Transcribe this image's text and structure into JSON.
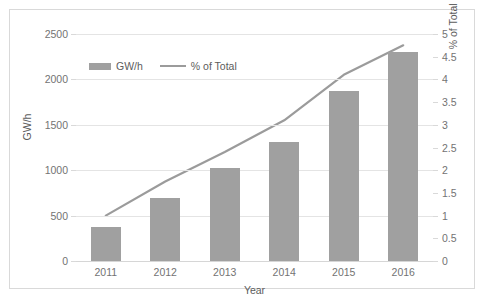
{
  "chart_data": {
    "type": "bar",
    "title": "",
    "subtitle": "",
    "xlabel": "Year",
    "ylabel": "GW/h",
    "y2label": "% of Total electricity production",
    "categories": [
      "2011",
      "2012",
      "2013",
      "2014",
      "2015",
      "2016"
    ],
    "series": [
      {
        "name": "GW/h",
        "type": "bar",
        "axis": "left",
        "color": "#a0a0a0",
        "values": [
          380,
          690,
          1020,
          1310,
          1870,
          2300
        ]
      },
      {
        "name": "% of Total",
        "type": "line",
        "axis": "right",
        "color": "#9b9b9b",
        "values": [
          1.0,
          1.75,
          2.4,
          3.1,
          4.1,
          4.75
        ]
      }
    ],
    "ylim": [
      0,
      2500
    ],
    "y2lim": [
      0,
      5
    ],
    "yticks": [
      0,
      500,
      1000,
      1500,
      2000,
      2500
    ],
    "yticklabels": [
      "0",
      "500",
      "1000",
      "1500",
      "2000",
      "2500"
    ],
    "y2ticks": [
      0,
      0.5,
      1,
      1.5,
      2,
      2.5,
      3,
      3.5,
      4,
      4.5,
      5
    ],
    "y2ticklabels": [
      "0",
      "0.5",
      "1",
      "1.5",
      "2",
      "2.5",
      "3",
      "3.5",
      "4",
      "4.5",
      "5"
    ],
    "grid": true,
    "legend": {
      "position": "top-left-inside",
      "entries": [
        {
          "label": "GW/h",
          "marker": "bar-swatch"
        },
        {
          "label": "% of Total",
          "marker": "line-swatch"
        }
      ]
    },
    "colors": {
      "bar": "#a0a0a0",
      "line": "#9b9b9b",
      "grid": "#e4e4e4",
      "axis_text": "#737373",
      "title_text": "#5c5c5c",
      "frame": "#d9d9d9",
      "background": "#ffffff"
    }
  }
}
